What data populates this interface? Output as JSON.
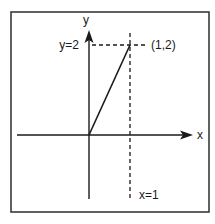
{
  "diagram": {
    "type": "cartesian-plot",
    "axes": {
      "x_label": "x",
      "y_label": "y"
    },
    "segment": {
      "from": [
        0,
        0
      ],
      "to": [
        1,
        2
      ]
    },
    "point_label": "(1,2)",
    "guides": {
      "vertical_label": "x=1",
      "horizontal_label": "y=2"
    },
    "colors": {
      "ink": "#1a1a1a",
      "frame": "#3a3a3a",
      "background": "#ffffff"
    }
  }
}
